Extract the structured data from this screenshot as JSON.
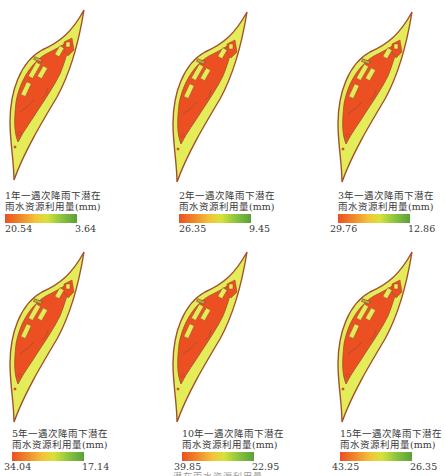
{
  "figure": {
    "panels": [
      {
        "return_period": "1年一遇",
        "title_line1": "1年一遇次降雨下潜在",
        "title_line2": "雨水资源利用量(mm)",
        "max_value": "20.54",
        "min_value": "3.64"
      },
      {
        "return_period": "2年一遇",
        "title_line1": "2年一遇次降雨下潜在",
        "title_line2": "雨水资源利用量(mm)",
        "max_value": "26.35",
        "min_value": "9.45"
      },
      {
        "return_period": "3年一遇",
        "title_line1": "3年一遇次降雨下潜在",
        "title_line2": "雨水资源利用量(mm)",
        "max_value": "29.76",
        "min_value": "12.86"
      },
      {
        "return_period": "5年一遇",
        "title_line1": "5年一遇次降雨下潜在",
        "title_line2": "雨水资源利用量(mm)",
        "max_value": "34.04",
        "min_value": "17.14"
      },
      {
        "return_period": "10年一遇",
        "title_line1": "10年一遇次降雨下潜在",
        "title_line2": "雨水资源利用量(mm)",
        "max_value": "39.85",
        "min_value": "22.95"
      },
      {
        "return_period": "15年一遇",
        "title_line1": "15年一遇次降雨下潜在",
        "title_line2": "雨水资源利用量(mm)",
        "max_value": "43.25",
        "min_value": "26.35"
      }
    ],
    "colors": {
      "high": "#ec4f22",
      "mid": "#f4c23a",
      "low_fill": "#e4ec5a",
      "legend_low": "#5aa03a",
      "outline": "#a0522d"
    },
    "caption_fragment": "……潜在雨水资源利用量……"
  }
}
